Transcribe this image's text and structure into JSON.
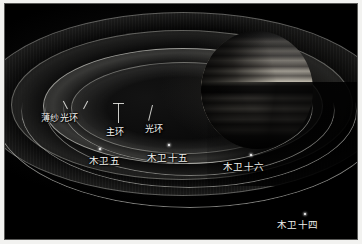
{
  "figure": {
    "background_color": "#000000",
    "frame_color": "#f2f2f0",
    "label_color": "#f2f2ee"
  },
  "planet": {
    "name": "木星",
    "illumination": "right-lit",
    "band_count": 12
  },
  "ring_labels": [
    {
      "id": "gossamer",
      "text": "薄纱光环",
      "leader": "vee"
    },
    {
      "id": "main",
      "text": "主环",
      "leader": "vertical"
    },
    {
      "id": "halo",
      "text": "光环",
      "leader": "diagonal"
    }
  ],
  "moon_labels": [
    {
      "id": "amalthea",
      "text": "木卫五",
      "marker": "dot"
    },
    {
      "id": "adrastea",
      "text": "木卫十五",
      "marker": "dot"
    },
    {
      "id": "metis",
      "text": "木卫十六",
      "marker": "dot"
    },
    {
      "id": "thebe",
      "text": "木卫十四",
      "marker": "dot"
    }
  ],
  "rings": [
    {
      "id": "gossamer-outer",
      "label": "薄纱光环"
    },
    {
      "id": "gossamer-inner",
      "label": "薄纱光环"
    },
    {
      "id": "main-ring",
      "label": "主环"
    },
    {
      "id": "halo-ring",
      "label": "光环"
    }
  ],
  "orbits": [
    {
      "id": "orbit-1"
    },
    {
      "id": "orbit-2"
    },
    {
      "id": "orbit-3"
    },
    {
      "id": "orbit-4"
    }
  ]
}
